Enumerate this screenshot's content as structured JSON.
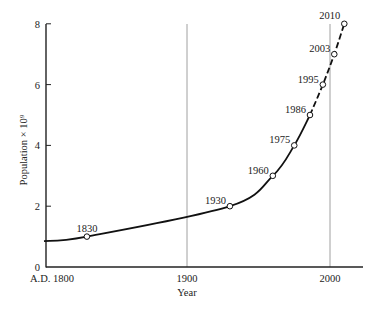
{
  "chart_data": {
    "type": "line",
    "title": "",
    "xlabel": "Year",
    "ylabel": "Population × 10⁹",
    "xlim": [
      1800,
      2023
    ],
    "ylim": [
      0,
      8
    ],
    "x_ticks": [
      {
        "value": 1800,
        "label": "A.D. 1800"
      },
      {
        "value": 1900,
        "label": "1900"
      },
      {
        "value": 2000,
        "label": "2000"
      }
    ],
    "y_ticks": [
      0,
      2,
      4,
      6,
      8
    ],
    "gridlines": [
      1900,
      2000
    ],
    "series": [
      {
        "name": "World population (billions)",
        "points": [
          {
            "x": 1830,
            "y": 1,
            "label": "1830"
          },
          {
            "x": 1930,
            "y": 2,
            "label": "1930"
          },
          {
            "x": 1960,
            "y": 3,
            "label": "1960"
          },
          {
            "x": 1975,
            "y": 4,
            "label": "1975"
          },
          {
            "x": 1986,
            "y": 5,
            "label": "1986"
          },
          {
            "x": 1995,
            "y": 6,
            "label": "1995"
          },
          {
            "x": 2003,
            "y": 7,
            "label": "2003"
          },
          {
            "x": 2010,
            "y": 8,
            "label": "2010"
          }
        ],
        "solid_until": 1986,
        "dashed_from": 1986,
        "curve_start": {
          "x": 1800,
          "y": 0.85
        }
      }
    ],
    "grid": false,
    "legend": null
  }
}
